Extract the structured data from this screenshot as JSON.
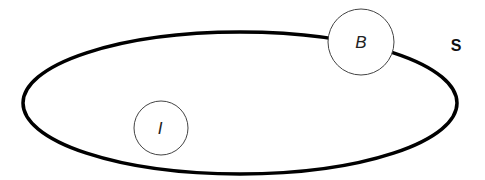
{
  "diagram": {
    "set_label": "S",
    "circles": [
      {
        "id": "B",
        "label": "B"
      },
      {
        "id": "I",
        "label": "I"
      }
    ]
  },
  "colors": {
    "ellipse_stroke": "#000000",
    "circle_stroke": "#444444",
    "background": "#ffffff"
  }
}
